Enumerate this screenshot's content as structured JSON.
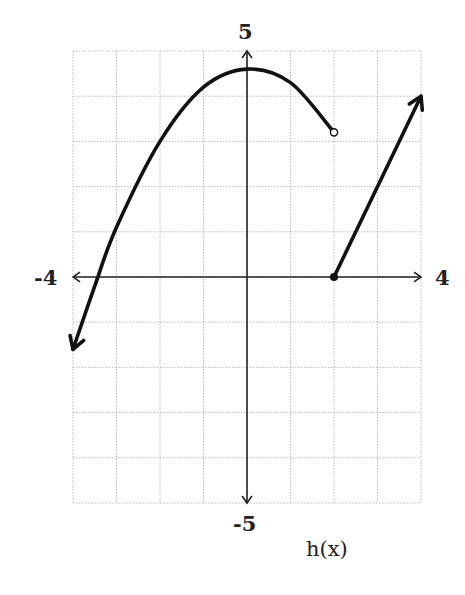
{
  "chart_data": {
    "type": "line",
    "title": "",
    "function_label": "h(x)",
    "xlabel": "",
    "ylabel": "",
    "xlim": [
      -4,
      4
    ],
    "ylim": [
      -5,
      5
    ],
    "x_tick_labels": {
      "min": "-4",
      "max": "4"
    },
    "y_tick_labels": {
      "max": "5",
      "min": "-5"
    },
    "grid": true,
    "grid_step": 1,
    "series": [
      {
        "name": "parabola piece",
        "kind": "curve",
        "domain": "x < 2",
        "points": [
          [
            -4.0,
            -1.6
          ],
          [
            -3.5,
            -0.2
          ],
          [
            -3,
            1.1
          ],
          [
            -2,
            3.0
          ],
          [
            -1,
            4.2
          ],
          [
            0,
            4.6
          ],
          [
            1,
            4.3
          ],
          [
            2,
            3.2
          ]
        ],
        "left_end": "arrow",
        "right_end": "open circle at (2, 3.2)"
      },
      {
        "name": "linear piece",
        "kind": "line",
        "domain": "x >= 2",
        "points": [
          [
            2,
            0
          ],
          [
            4,
            4
          ]
        ],
        "left_end": "closed dot at (2, 0)",
        "right_end": "arrow"
      }
    ]
  }
}
